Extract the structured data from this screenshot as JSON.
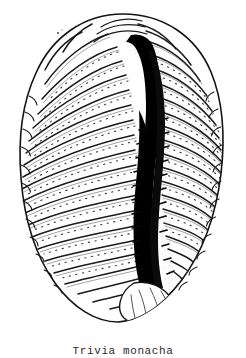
{
  "plate": {
    "background_color": "#ffffff",
    "ink_color": "#1a1a1a"
  },
  "figure": {
    "name": "shell-illustration",
    "subject": "Trivia monacha",
    "view": "ventral view of cowrie shell",
    "technique": "stippled pen-and-ink line engraving",
    "outline_color": "#141414",
    "rib_color": "#1d1d1d",
    "aperture_color": "#000000",
    "shell_fill": "#ffffff",
    "rib_count": 26,
    "aperture_label": "aperture-slit"
  },
  "caption": {
    "text": "Trivia monacha"
  }
}
